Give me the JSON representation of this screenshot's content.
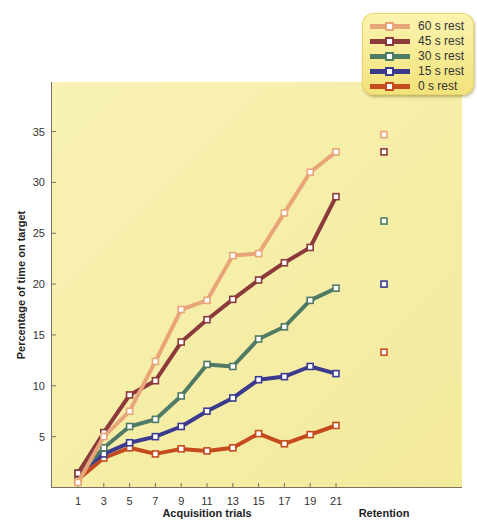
{
  "chart_data": {
    "type": "line",
    "title": "",
    "xlabel": "Acquisition trials",
    "ylabel": "Percentage of time on target",
    "retention_label": "Retention",
    "x": [
      1,
      3,
      5,
      7,
      9,
      11,
      13,
      15,
      17,
      19,
      21
    ],
    "x_ticks": [
      "1",
      "3",
      "5",
      "7",
      "9",
      "11",
      "13",
      "15",
      "17",
      "19",
      "21"
    ],
    "y_ticks": [
      "5",
      "10",
      "15",
      "20",
      "25",
      "30",
      "35"
    ],
    "ylim": [
      0,
      39
    ],
    "grid": false,
    "legend_position": "top-right",
    "series": [
      {
        "name": "60 s rest",
        "color": "#e8a57a",
        "values": [
          0.5,
          5.0,
          7.5,
          12.4,
          17.5,
          18.4,
          22.8,
          23.0,
          27.0,
          31.0,
          33.0
        ],
        "retention": 34.7
      },
      {
        "name": "45 s rest",
        "color": "#8c3a3c",
        "values": [
          1.4,
          5.4,
          9.1,
          10.5,
          14.3,
          16.5,
          18.5,
          20.4,
          22.1,
          23.6,
          28.6
        ],
        "retention": 33.0
      },
      {
        "name": "30 s rest",
        "color": "#4f7a64",
        "values": [
          1.3,
          3.9,
          6.0,
          6.7,
          9.0,
          12.1,
          11.9,
          14.6,
          15.8,
          18.4,
          19.6
        ],
        "retention": 26.2
      },
      {
        "name": "15 s rest",
        "color": "#3a3b8f",
        "values": [
          1.4,
          3.3,
          4.4,
          5.0,
          6.0,
          7.5,
          8.8,
          10.6,
          10.9,
          11.9,
          11.2
        ],
        "retention": 20.0
      },
      {
        "name": "0 s rest",
        "color": "#c54b1e",
        "values": [
          0.8,
          2.9,
          3.9,
          3.3,
          3.8,
          3.6,
          3.9,
          5.3,
          4.3,
          5.2,
          6.1
        ],
        "retention": 13.3
      }
    ]
  },
  "legend": {
    "items": [
      {
        "label": "60 s rest",
        "color": "#e8a57a"
      },
      {
        "label": "45 s rest",
        "color": "#8c3a3c"
      },
      {
        "label": "30 s rest",
        "color": "#4f7a64"
      },
      {
        "label": "15 s rest",
        "color": "#3a3b8f"
      },
      {
        "label": "0 s rest",
        "color": "#c54b1e"
      }
    ]
  },
  "colors": {
    "plot_background_top": "#f8f2b4",
    "plot_background_bottom": "#f3ea9c",
    "axis": "#7a7060"
  }
}
